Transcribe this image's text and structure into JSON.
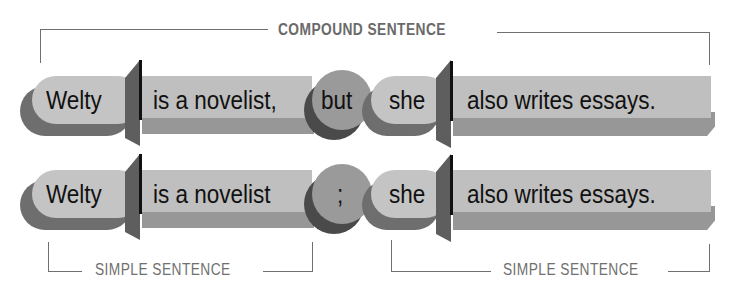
{
  "labels": {
    "compound": "COMPOUND SENTENCE",
    "simple_left": "SIMPLE SENTENCE",
    "simple_right": "SIMPLE SENTENCE"
  },
  "rows": [
    {
      "subject1": "Welty",
      "predicate1": "is a novelist,",
      "joiner": "but",
      "joiner_type": "coordinating-conjunction",
      "subject2": "she",
      "predicate2": "also writes essays."
    },
    {
      "subject1": "Welty",
      "predicate1": "is a novelist",
      "joiner": ";",
      "joiner_type": "semicolon",
      "subject2": "she",
      "predicate2": "also writes essays."
    }
  ],
  "colors": {
    "pill": "#c4c4c4",
    "pill_shadow": "#6e6e6e",
    "rect": "#bfbfbf",
    "rect_bevel": "#979797",
    "joiner": "#9a9a9a",
    "joiner_shadow": "#4a4a4a",
    "bracket": "#6f6f6f"
  }
}
